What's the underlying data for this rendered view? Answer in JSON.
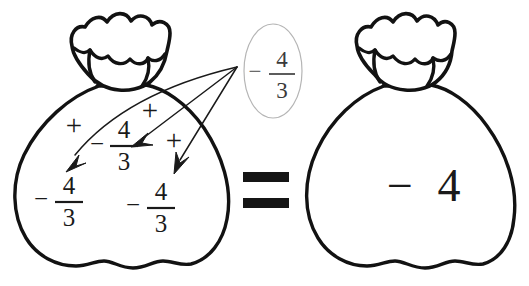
{
  "diagram": {
    "equation_plain": "(-4/3) + (-4/3) + (-4/3) = -4",
    "left_bag": {
      "name": "left-sack",
      "label": "sack containing three copies of negative four thirds",
      "terms": [
        {
          "sign": "−",
          "numerator": "4",
          "denominator": "3"
        },
        {
          "sign": "−",
          "numerator": "4",
          "denominator": "3"
        },
        {
          "sign": "−",
          "numerator": "4",
          "denominator": "3"
        }
      ],
      "operators": [
        "+",
        "+",
        "+"
      ]
    },
    "callout": {
      "name": "callout-value",
      "sign": "−",
      "numerator": "4",
      "denominator": "3",
      "value_plain": "-4/3",
      "arrow_count": 3,
      "shape": "ellipse",
      "stroke_color": "#b5b5b5"
    },
    "relation": {
      "symbol": "=",
      "name": "equals-sign"
    },
    "right_bag": {
      "name": "right-sack",
      "label": "sack containing negative four",
      "sign": "−",
      "value": "4",
      "value_plain": "-4"
    },
    "colors": {
      "ink": "#121212",
      "text": "#1a1a1a",
      "callout_stroke": "#b5b5b5",
      "callout_text": "#3a3a3a",
      "background": "#ffffff"
    }
  }
}
